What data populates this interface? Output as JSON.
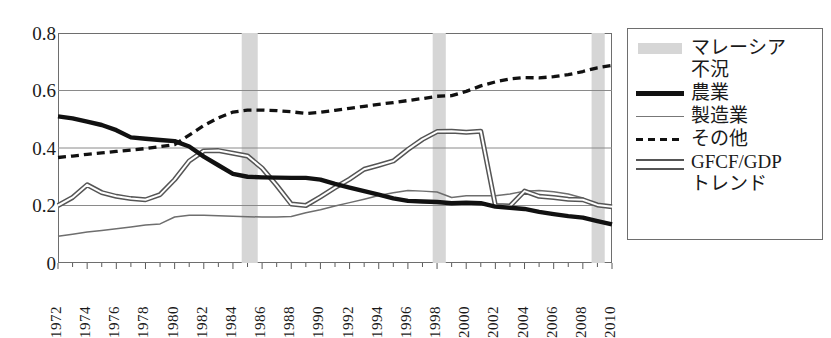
{
  "chart_data": {
    "type": "line",
    "title": "",
    "xlabel": "",
    "ylabel": "",
    "xlim": [
      1972,
      2010
    ],
    "ylim": [
      0,
      0.8
    ],
    "grid": "horizontal",
    "legend_position": "right-outside",
    "y_ticks": [
      "0.8",
      "0.6",
      "0.4",
      "0.2",
      "0"
    ],
    "y_tick_values": [
      0.8,
      0.6,
      0.4,
      0.2,
      0
    ],
    "x_ticks": [
      "1972",
      "1974",
      "1976",
      "1978",
      "1980",
      "1982",
      "1984",
      "1986",
      "1988",
      "1990",
      "1992",
      "1994",
      "1996",
      "1998",
      "2000",
      "2002",
      "2004",
      "2006",
      "2008",
      "2010"
    ],
    "x": [
      1972,
      1973,
      1974,
      1975,
      1976,
      1977,
      1978,
      1979,
      1980,
      1981,
      1982,
      1983,
      1984,
      1985,
      1986,
      1987,
      1988,
      1989,
      1990,
      1991,
      1992,
      1993,
      1994,
      1995,
      1996,
      1997,
      1998,
      1999,
      2000,
      2001,
      2002,
      2003,
      2004,
      2005,
      2006,
      2007,
      2008,
      2009,
      2010
    ],
    "series": [
      {
        "name": "農業",
        "style": "thick-solid",
        "color": "#111111",
        "values": [
          0.51,
          0.503,
          0.492,
          0.48,
          0.462,
          0.437,
          0.432,
          0.428,
          0.424,
          0.405,
          0.37,
          0.34,
          0.31,
          0.3,
          0.298,
          0.297,
          0.296,
          0.296,
          0.29,
          0.275,
          0.262,
          0.25,
          0.238,
          0.225,
          0.216,
          0.214,
          0.212,
          0.208,
          0.21,
          0.208,
          0.196,
          0.192,
          0.188,
          0.178,
          0.17,
          0.163,
          0.158,
          0.146,
          0.134
        ]
      },
      {
        "name": "製造業",
        "style": "thin-solid",
        "color": "#6e6e6e",
        "values": [
          0.093,
          0.1,
          0.108,
          0.113,
          0.119,
          0.125,
          0.132,
          0.136,
          0.16,
          0.166,
          0.166,
          0.164,
          0.163,
          0.161,
          0.16,
          0.16,
          0.162,
          0.175,
          0.185,
          0.198,
          0.21,
          0.222,
          0.235,
          0.244,
          0.252,
          0.25,
          0.247,
          0.228,
          0.234,
          0.234,
          0.234,
          0.24,
          0.25,
          0.252,
          0.248,
          0.24,
          0.226,
          0.198,
          0.196
        ]
      },
      {
        "name": "その他",
        "style": "dashed",
        "color": "#111111",
        "values": [
          0.367,
          0.372,
          0.378,
          0.383,
          0.388,
          0.393,
          0.398,
          0.405,
          0.412,
          0.445,
          0.478,
          0.505,
          0.525,
          0.532,
          0.532,
          0.53,
          0.526,
          0.52,
          0.524,
          0.531,
          0.538,
          0.545,
          0.552,
          0.558,
          0.565,
          0.572,
          0.58,
          0.582,
          0.597,
          0.616,
          0.63,
          0.64,
          0.645,
          0.644,
          0.648,
          0.655,
          0.666,
          0.679,
          0.687
        ]
      },
      {
        "name": "GFCF/GDP トレンド",
        "style": "hollow-thick",
        "color": "#555555",
        "values": [
          0.2,
          0.228,
          0.272,
          0.245,
          0.232,
          0.224,
          0.22,
          0.238,
          0.29,
          0.355,
          0.39,
          0.391,
          0.382,
          0.372,
          0.33,
          0.27,
          0.205,
          0.2,
          0.23,
          0.262,
          0.292,
          0.326,
          0.34,
          0.355,
          0.395,
          0.43,
          0.457,
          0.458,
          0.455,
          0.458,
          0.2,
          0.198,
          0.25,
          0.232,
          0.228,
          0.222,
          0.22,
          0.202,
          0.196
        ]
      }
    ],
    "shaded_bands": {
      "name": "マレーシア不況",
      "color": "#d6d6d6",
      "ranges": [
        [
          1984.6,
          1985.7
        ],
        [
          1997.7,
          1998.6
        ],
        [
          2008.6,
          2009.5
        ]
      ]
    }
  },
  "legend": {
    "items": [
      {
        "label": "マレーシア\n不況",
        "swatch": "band"
      },
      {
        "label": "農業",
        "swatch": "thick"
      },
      {
        "label": "製造業",
        "swatch": "thin"
      },
      {
        "label": "その他",
        "swatch": "dash"
      },
      {
        "label": "GFCF/GDP\nトレンド",
        "swatch": "hollow"
      }
    ]
  },
  "colors": {
    "frame": "#6e6e6e",
    "grid": "#8a8a8a",
    "band": "#d6d6d6",
    "agriculture": "#111111",
    "manufacturing": "#6e6e6e",
    "other": "#111111",
    "gfcf": "#555555",
    "background": "#ffffff"
  }
}
